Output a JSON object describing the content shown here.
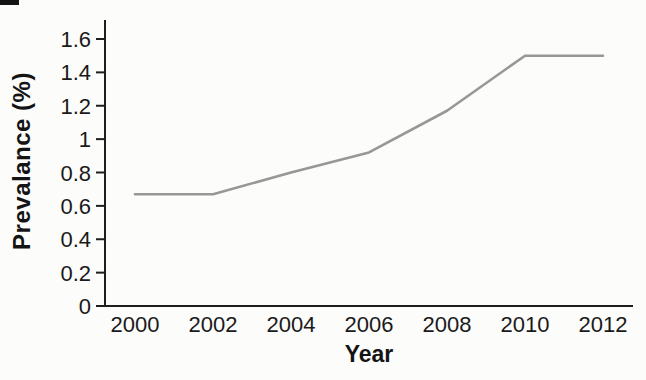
{
  "figure": {
    "background_color": "#fcfcfb",
    "artifact_color": "#141414"
  },
  "chart_data": {
    "type": "line",
    "title": "",
    "xlabel": "Year",
    "ylabel": "Prevalance (%)",
    "x": [
      2000,
      2002,
      2004,
      2006,
      2008,
      2010,
      2012
    ],
    "x_tick_labels": [
      "2000",
      "2002",
      "2004",
      "2006",
      "2008",
      "2010",
      "2012"
    ],
    "series": [
      {
        "name": "Prevalence",
        "values": [
          0.67,
          0.67,
          0.8,
          0.92,
          1.17,
          1.5,
          1.5
        ]
      }
    ],
    "y_tick_values": [
      0,
      0.2,
      0.4,
      0.6,
      0.8,
      1,
      1.2,
      1.4,
      1.6
    ],
    "y_tick_labels": [
      "0",
      "0.2",
      "0.4",
      "0.6",
      "0.8",
      "1",
      "1.2",
      "1.4",
      "1.6"
    ],
    "xlim": [
      2000,
      2012
    ],
    "ylim": [
      0,
      1.6
    ],
    "grid": false,
    "legend": "none",
    "line_color": "#979797",
    "axis_color": "#1e1e1e",
    "text_color": "#1a1a1a"
  }
}
